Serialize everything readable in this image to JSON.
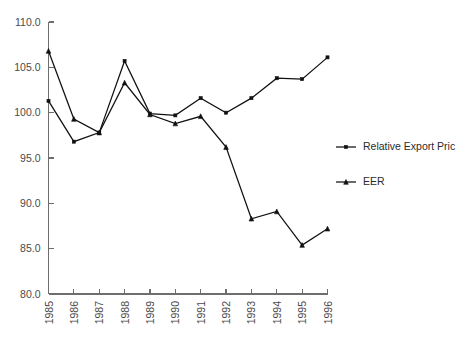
{
  "chart_data": {
    "type": "line",
    "title": "",
    "subtitle": "",
    "xlabel": "",
    "ylabel": "",
    "x": [
      1985,
      1986,
      1987,
      1988,
      1989,
      1990,
      1991,
      1992,
      1993,
      1994,
      1995,
      1996
    ],
    "categories": [
      "1985",
      "1986",
      "1987",
      "1988",
      "1989",
      "1990",
      "1991",
      "1992",
      "1993",
      "1994",
      "1995",
      "1996"
    ],
    "xtick_labels": [
      "1985",
      "1986",
      "1987",
      "1988",
      "1989",
      "1990",
      "1991",
      "1992",
      "1993",
      "1994",
      "1995",
      "1996"
    ],
    "ytick_labels": [
      "80.0",
      "85.0",
      "90.0",
      "95.0",
      "100.0",
      "105.0",
      "110.0"
    ],
    "ytick_values": [
      80.0,
      85.0,
      90.0,
      95.0,
      100.0,
      105.0,
      110.0
    ],
    "ylim": [
      80.0,
      110.0
    ],
    "xlim": [
      1985,
      1996
    ],
    "grid": false,
    "legend_position": "right",
    "series": [
      {
        "name": "Relative Export Pric",
        "marker": "square",
        "color": "#111111",
        "values": [
          101.3,
          96.8,
          97.8,
          105.7,
          99.9,
          99.7,
          101.6,
          100.0,
          101.6,
          103.8,
          103.7,
          106.1
        ]
      },
      {
        "name": "EER",
        "marker": "triangle",
        "color": "#111111",
        "values": [
          106.8,
          99.3,
          97.8,
          103.3,
          99.8,
          98.8,
          99.6,
          96.2,
          88.3,
          89.1,
          85.4,
          87.2
        ]
      }
    ]
  },
  "legend": {
    "entries": [
      {
        "label": "Relative Export Pric",
        "marker": "square"
      },
      {
        "label": "EER",
        "marker": "triangle"
      }
    ]
  },
  "axes": {
    "y_axis_name": "value-axis",
    "x_axis_name": "year-axis"
  }
}
